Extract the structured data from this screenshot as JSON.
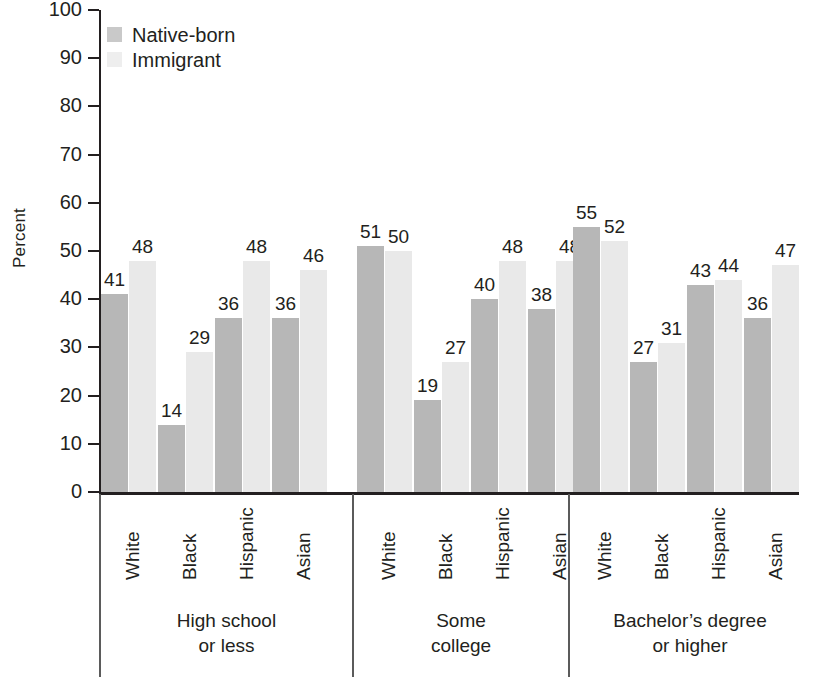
{
  "chart_data": {
    "type": "bar",
    "title": "",
    "subtitle": "",
    "xlabel": "",
    "ylabel": "Percent",
    "ylim": [
      0,
      100
    ],
    "yticks": [
      0,
      10,
      20,
      30,
      40,
      50,
      60,
      70,
      80,
      90,
      100
    ],
    "grid": false,
    "legend_position": "top-left",
    "legend": [
      "Native-born",
      "Immigrant"
    ],
    "group_labels": [
      {
        "line1": "High school",
        "line2": "or less"
      },
      {
        "line1": "Some",
        "line2": "college"
      },
      {
        "line1": "Bachelor’s degree",
        "line2": "or higher"
      }
    ],
    "categories": [
      "White",
      "Black",
      "Hispanic",
      "Asian"
    ],
    "series": [
      {
        "name": "Native-born",
        "color": "#b7b7b7"
      },
      {
        "name": "Immigrant",
        "color": "#e9e9e9"
      }
    ],
    "groups": [
      {
        "label": "High school or less",
        "bars": [
          {
            "category": "White",
            "native": 41,
            "immigrant": 48
          },
          {
            "category": "Black",
            "native": 14,
            "immigrant": 29
          },
          {
            "category": "Hispanic",
            "native": 36,
            "immigrant": 48
          },
          {
            "category": "Asian",
            "native": 36,
            "immigrant": 46
          }
        ]
      },
      {
        "label": "Some college",
        "bars": [
          {
            "category": "White",
            "native": 51,
            "immigrant": 50
          },
          {
            "category": "Black",
            "native": 19,
            "immigrant": 27
          },
          {
            "category": "Hispanic",
            "native": 40,
            "immigrant": 48
          },
          {
            "category": "Asian",
            "native": 38,
            "immigrant": 48
          }
        ]
      },
      {
        "label": "Bachelor’s degree or higher",
        "bars": [
          {
            "category": "White",
            "native": 55,
            "immigrant": 52
          },
          {
            "category": "Black",
            "native": 27,
            "immigrant": 31
          },
          {
            "category": "Hispanic",
            "native": 43,
            "immigrant": 44
          },
          {
            "category": "Asian",
            "native": 36,
            "immigrant": 47
          }
        ]
      }
    ]
  },
  "colors": {
    "native_born": "#b7b7b7",
    "immigrant": "#e9e9e9",
    "axis": "#231f20",
    "separator": "#5b5b5b",
    "text": "#231f20",
    "background": "#ffffff"
  }
}
